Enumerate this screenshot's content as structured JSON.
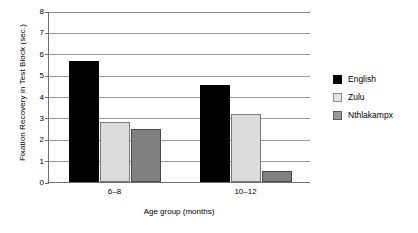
{
  "chart_data": {
    "type": "bar",
    "title": "",
    "xlabel": "Age group (months)",
    "ylabel": "Fixation Recovery in Test Block (sec.)",
    "categories": [
      "6–8",
      "10–12"
    ],
    "yticks": [
      "0",
      "1",
      "2",
      "3",
      "4",
      "5",
      "6",
      "7",
      "8"
    ],
    "ylim": [
      0,
      8
    ],
    "grid": true,
    "legend_position": "right",
    "series": [
      {
        "name": "English",
        "color": "#000000",
        "values": [
          5.65,
          4.55
        ]
      },
      {
        "name": "Zulu",
        "color": "#dcdcdc",
        "values": [
          2.8,
          3.2
        ]
      },
      {
        "name": "Nthlakampx",
        "color": "#808080",
        "values": [
          2.5,
          0.5
        ]
      }
    ]
  },
  "legend": {
    "items": [
      {
        "label": "English"
      },
      {
        "label": "Zulu"
      },
      {
        "label": "Nthlakampx"
      }
    ]
  }
}
